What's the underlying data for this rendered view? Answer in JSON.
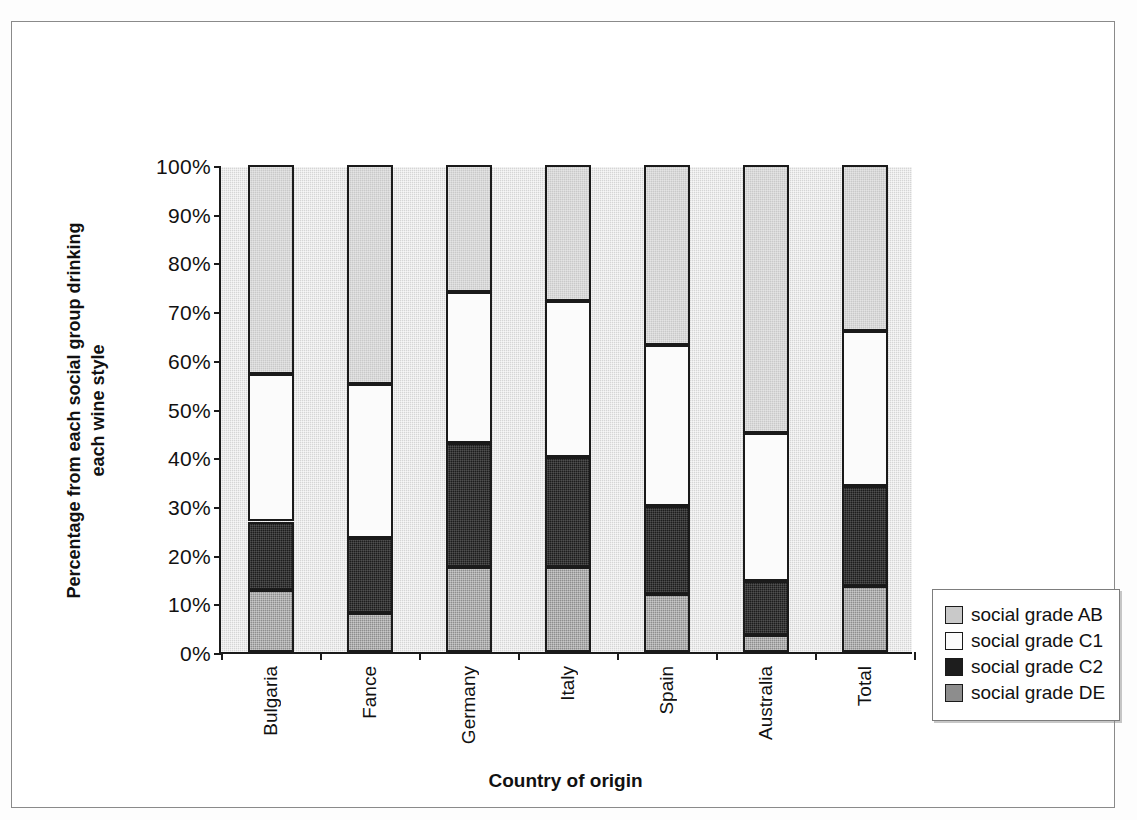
{
  "chart_data": {
    "type": "bar",
    "subtype": "stacked-100-percent",
    "title": "",
    "xlabel": "Country of origin",
    "ylabel": "Percentage from each social group drinking each wine style",
    "categories": [
      "Bulgaria",
      "Fance",
      "Germany",
      "Italy",
      "Spain",
      "Australia",
      "Total"
    ],
    "ylim": [
      0,
      100
    ],
    "y_tick_labels": [
      "0%",
      "10%",
      "20%",
      "30%",
      "40%",
      "50%",
      "60%",
      "70%",
      "80%",
      "90%",
      "100%"
    ],
    "y_tick_values": [
      0,
      10,
      20,
      30,
      40,
      50,
      60,
      70,
      80,
      90,
      100
    ],
    "grid": false,
    "legend_position": "right",
    "stack_order_bottom_to_top": [
      "social grade DE",
      "social grade C2",
      "social grade C1",
      "social grade AB"
    ],
    "series": [
      {
        "name": "social grade DE",
        "color": "#8d8d8d",
        "values": [
          12.8,
          8.0,
          17.5,
          17.5,
          12.0,
          3.5,
          13.5
        ]
      },
      {
        "name": "social grade C2",
        "color": "#1d1d1d",
        "values": [
          14.0,
          15.5,
          25.5,
          22.5,
          18.0,
          11.0,
          20.5
        ]
      },
      {
        "name": "social grade C1",
        "color": "#fbfbfb",
        "values": [
          30.2,
          31.5,
          31.0,
          32.0,
          33.0,
          30.5,
          32.0
        ]
      },
      {
        "name": "social grade AB",
        "color": "#c9c9c9",
        "values": [
          43.0,
          45.0,
          26.0,
          28.0,
          37.0,
          55.0,
          34.0
        ]
      }
    ],
    "cumulative_tops_percent": {
      "Bulgaria": {
        "DE": 12.8,
        "C2": 26.8,
        "C1": 57.0,
        "AB": 100
      },
      "Fance": {
        "DE": 8.0,
        "C2": 23.5,
        "C1": 55.0,
        "AB": 100
      },
      "Germany": {
        "DE": 17.5,
        "C2": 43.0,
        "C1": 74.0,
        "AB": 100
      },
      "Italy": {
        "DE": 17.5,
        "C2": 40.0,
        "C1": 72.0,
        "AB": 100
      },
      "Spain": {
        "DE": 12.0,
        "C2": 30.0,
        "C1": 63.0,
        "AB": 100
      },
      "Australia": {
        "DE": 3.5,
        "C2": 14.5,
        "C1": 45.0,
        "AB": 100
      },
      "Total": {
        "DE": 13.5,
        "C2": 34.0,
        "C1": 66.0,
        "AB": 100
      }
    }
  },
  "legend": {
    "items": [
      {
        "label": "social grade AB",
        "swatch": "#c9c9c9"
      },
      {
        "label": "social grade C1",
        "swatch": "#fbfbfb"
      },
      {
        "label": "social grade C2",
        "swatch": "#1d1d1d"
      },
      {
        "label": "social grade DE",
        "swatch": "#8d8d8d"
      }
    ]
  },
  "axes": {
    "x_title": "Country of origin",
    "y_title_line1": "Percentage from each social group drinking",
    "y_title_line2": "each wine style"
  }
}
